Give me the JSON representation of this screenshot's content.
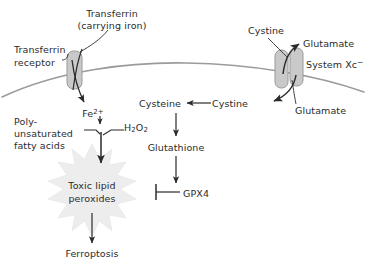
{
  "diagram": {
    "background_color": "#ffffff",
    "ink_color": "#2b2b2b",
    "membrane_color": "#9b9b9b",
    "transporter_fill": "#c9c9c9",
    "burst_fill": "#ededed"
  },
  "labels": {
    "transferrin": "Transferrin",
    "transferrin_carrying_iron": "(carrying iron)",
    "transferrin_receptor_line1": "Transferrin",
    "transferrin_receptor_line2": "receptor",
    "iron": "Fe",
    "iron_charge": "2+",
    "hydrogen_peroxide": "H",
    "hydrogen_peroxide_sub1": "2",
    "hydrogen_peroxide_mid": "O",
    "hydrogen_peroxide_sub2": "2",
    "pufa_line1": "Poly-",
    "pufa_line2": "unsaturated",
    "pufa_line3": "fatty acids",
    "toxic_lipid_line1": "Toxic lipid",
    "toxic_lipid_line2": "peroxides",
    "ferroptosis": "Ferroptosis",
    "cystine_outside": "Cystine",
    "cystine_inside": "Cystine",
    "cysteine": "Cysteine",
    "glutamate_out": "Glutamate",
    "glutamate_in": "Glutamate",
    "system_xc": "System Xc",
    "system_xc_charge": "−",
    "glutathione": "Glutathione",
    "gpx4": "GPX4"
  },
  "nodes": [
    {
      "id": "transferrin",
      "label": "Transferrin (carrying iron)",
      "x": 112,
      "y": 14
    },
    {
      "id": "transferrin-receptor",
      "label": "Transferrin receptor",
      "x": 42,
      "y": 52
    },
    {
      "id": "fe2",
      "label": "Fe2+",
      "x": 93,
      "y": 112
    },
    {
      "id": "h2o2",
      "label": "H2O2",
      "x": 131,
      "y": 127
    },
    {
      "id": "pufa",
      "label": "Poly-unsaturated fatty acids",
      "x": 45,
      "y": 128
    },
    {
      "id": "toxic-lipid-peroxides",
      "label": "Toxic lipid peroxides",
      "x": 92,
      "y": 190
    },
    {
      "id": "ferroptosis",
      "label": "Ferroptosis",
      "x": 92,
      "y": 253
    },
    {
      "id": "cystine-out",
      "label": "Cystine",
      "x": 266,
      "y": 30
    },
    {
      "id": "glutamate-out",
      "label": "Glutamate",
      "x": 323,
      "y": 44
    },
    {
      "id": "system-xc",
      "label": "System Xc-",
      "x": 326,
      "y": 63
    },
    {
      "id": "glutamate-in",
      "label": "Glutamate",
      "x": 323,
      "y": 110
    },
    {
      "id": "cystine-in",
      "label": "Cystine",
      "x": 230,
      "y": 105
    },
    {
      "id": "cysteine",
      "label": "Cysteine",
      "x": 174,
      "y": 105
    },
    {
      "id": "glutathione",
      "label": "Glutathione",
      "x": 178,
      "y": 148
    },
    {
      "id": "gpx4",
      "label": "GPX4",
      "x": 198,
      "y": 196
    }
  ],
  "edges": [
    {
      "from": "transferrin-receptor",
      "to": "fe2",
      "type": "arrow"
    },
    {
      "from": "pufa",
      "to": "toxic-lipid-peroxides",
      "type": "arrow"
    },
    {
      "from": "fe2",
      "to": "toxic-lipid-peroxides",
      "type": "arrow"
    },
    {
      "from": "h2o2",
      "to": "toxic-lipid-peroxides",
      "type": "arrow"
    },
    {
      "from": "toxic-lipid-peroxides",
      "to": "ferroptosis",
      "type": "arrow"
    },
    {
      "from": "cystine-out",
      "to": "cystine-in",
      "type": "arrow"
    },
    {
      "from": "system-xc",
      "to": "glutamate-out",
      "type": "arrow"
    },
    {
      "from": "cystine-in",
      "to": "cysteine",
      "type": "arrow"
    },
    {
      "from": "cysteine",
      "to": "glutathione",
      "type": "arrow"
    },
    {
      "from": "glutathione",
      "to": "gpx4",
      "type": "arrow"
    },
    {
      "from": "gpx4",
      "to": "toxic-lipid-peroxides",
      "type": "inhibition"
    }
  ]
}
